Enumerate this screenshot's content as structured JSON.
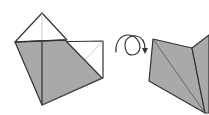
{
  "diagram": {
    "type": "origami-fold-step",
    "colors": {
      "paper_back": "#a9a9a9",
      "paper_front": "#ffffff",
      "edge": "#333333",
      "crease": "#bdbdbd"
    },
    "steps": [
      {
        "name": "folded-model-before",
        "description": "Square base with top flap raised, gray underside visible"
      },
      {
        "name": "turn-over-symbol",
        "icon": "flip-over-arrow-icon"
      },
      {
        "name": "folded-model-after",
        "description": "Model turned over, showing gray folded flaps"
      }
    ]
  }
}
